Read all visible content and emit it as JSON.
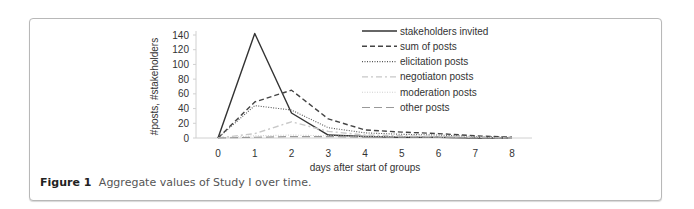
{
  "figure": {
    "label": "Figure 1",
    "caption": "Aggregate values of Study I over time."
  },
  "chart_data": {
    "type": "line",
    "title": "",
    "xlabel": "days after start of groups",
    "ylabel": "#posts, #stakeholders",
    "x": [
      0,
      1,
      2,
      3,
      4,
      5,
      6,
      7,
      8
    ],
    "ylim": [
      0,
      140
    ],
    "yticks": [
      0,
      20,
      40,
      60,
      80,
      100,
      120,
      140
    ],
    "xticks": [
      0,
      1,
      2,
      3,
      4,
      5,
      6,
      7,
      8
    ],
    "grid": false,
    "legend_position": "upper right",
    "series": [
      {
        "name": "stakeholders invited",
        "style": "solid",
        "color": "#333333",
        "values": [
          0,
          142,
          34,
          4,
          2,
          1,
          1,
          0,
          0
        ]
      },
      {
        "name": "sum of posts",
        "style": "dashed",
        "color": "#444444",
        "values": [
          0,
          49,
          65,
          26,
          11,
          8,
          6,
          3,
          1
        ]
      },
      {
        "name": "elicitation posts",
        "style": "dotted",
        "color": "#555555",
        "values": [
          0,
          44,
          38,
          14,
          7,
          5,
          4,
          2,
          1
        ]
      },
      {
        "name": "negotiaton posts",
        "style": "dash-dot",
        "color": "#c8c8c8",
        "values": [
          0,
          6,
          22,
          9,
          4,
          3,
          2,
          1,
          0
        ]
      },
      {
        "name": "moderation posts",
        "style": "dotted",
        "color": "#d0d0d0",
        "values": [
          0,
          3,
          4,
          3,
          2,
          2,
          1,
          1,
          0
        ]
      },
      {
        "name": "other posts",
        "style": "long-dash",
        "color": "#999999",
        "values": [
          0,
          1,
          2,
          2,
          1,
          1,
          1,
          0,
          0
        ]
      }
    ]
  }
}
